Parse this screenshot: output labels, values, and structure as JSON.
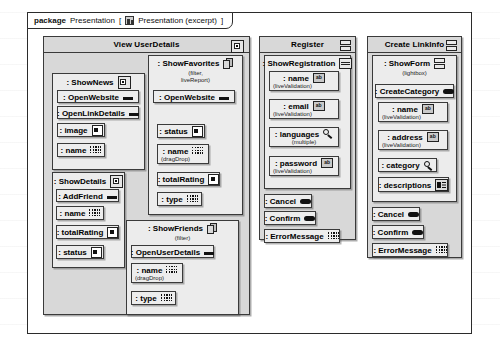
{
  "package": {
    "keyword": "package",
    "name": "Presentation",
    "bracket_open": "[",
    "icon": "diagram-icon",
    "diagram_label": "Presentation (excerpt)",
    "bracket_close": "]"
  },
  "columns": [
    {
      "id": "view-userdetails",
      "title": "View UserDetails",
      "icon": "window-icon"
    },
    {
      "id": "register",
      "title": "Register",
      "icon": "panes-icon"
    },
    {
      "id": "create-linkinfo",
      "title": "Create LinkInfo",
      "icon": "panes-icon"
    }
  ],
  "nodes": {
    "show_news": {
      "title": ": ShowNews",
      "icon": "window-icon",
      "items": [
        {
          "label": ": OpenWebsite",
          "icon": "link-icon",
          "note": ""
        },
        {
          "label": ": OpenLinkDetails",
          "icon": "link-icon",
          "note": ""
        },
        {
          "label": ": image",
          "icon": "image-icon",
          "note": ""
        },
        {
          "label": ": name",
          "icon": "text-icon",
          "note": ""
        }
      ]
    },
    "show_details": {
      "title": ": ShowDetails",
      "icon": "window-icon",
      "items": [
        {
          "label": ": AddFriend",
          "icon": "link-icon",
          "note": ""
        },
        {
          "label": ": name",
          "icon": "text-icon",
          "note": ""
        },
        {
          "label": ": totalRating",
          "icon": "image-icon",
          "note": ""
        },
        {
          "label": ": status",
          "icon": "image-icon",
          "note": ""
        }
      ]
    },
    "show_favorites": {
      "title": ": ShowFavorites",
      "icon": "stack-icon",
      "sub": "(filter,\nliveReport)",
      "sub_line1": "(filter,",
      "sub_line2": "liveReport)",
      "items": [
        {
          "label": ": OpenWebsite",
          "icon": "link-icon",
          "note": ""
        },
        {
          "label": ": status",
          "icon": "image-icon",
          "note": ""
        },
        {
          "label": ": name",
          "icon": "text-icon",
          "note": "(dragDrop)"
        },
        {
          "label": ": totalRating",
          "icon": "image-icon",
          "note": ""
        },
        {
          "label": ": type",
          "icon": "text-icon",
          "note": ""
        }
      ]
    },
    "show_friends": {
      "title": ": ShowFriends",
      "icon": "stack-icon",
      "sub_line1": "(filter)",
      "items": [
        {
          "label": ": OpenUserDetails",
          "icon": "link-icon",
          "note": ""
        },
        {
          "label": ": name",
          "icon": "text-icon",
          "note": "(dragDrop)"
        },
        {
          "label": ": type",
          "icon": "text-icon",
          "note": ""
        }
      ]
    },
    "show_registration": {
      "title": ": ShowRegistration",
      "icon": "panes2-icon",
      "items": [
        {
          "label": ": name",
          "icon": "ab-icon",
          "note": "(liveValidation)"
        },
        {
          "label": ": email",
          "icon": "ab-icon",
          "note": "(liveValidation)"
        },
        {
          "label": ": languages",
          "icon": "select-icon",
          "note": "(multiple)"
        },
        {
          "label": ": password",
          "icon": "ab-icon",
          "note": "(liveValidation)"
        }
      ]
    },
    "register_actions": [
      {
        "label": ": Cancel",
        "icon": "button-icon"
      },
      {
        "label": ": Confirm",
        "icon": "button-icon"
      },
      {
        "label": ": ErrorMessage",
        "icon": "text-icon"
      }
    ],
    "show_form": {
      "title": ": ShowForm",
      "icon": "panes-icon",
      "sub_line1": "(lightbox)",
      "create_category": {
        "label": ": CreateCategory",
        "icon": "button-icon"
      },
      "items": [
        {
          "label": ": name",
          "icon": "ab-icon",
          "note": "(liveValidation)"
        },
        {
          "label": ": address",
          "icon": "ab-icon",
          "note": "(liveValidation)"
        },
        {
          "label": ": category",
          "icon": "select-icon",
          "note": ""
        },
        {
          "label": ": descriptions",
          "icon": "desc-icon",
          "note": ""
        }
      ]
    },
    "linkinfo_actions": [
      {
        "label": ": Cancel",
        "icon": "button-icon"
      },
      {
        "label": ": Confirm",
        "icon": "button-icon"
      },
      {
        "label": ": ErrorMessage",
        "icon": "text-icon"
      }
    ]
  },
  "colors": {
    "panel_fill": "#d8d8d8",
    "node_fill": "#ececec",
    "leaf_fill": "#ededed",
    "stroke": "#3a3a3a",
    "page_bg": "#ffffff"
  }
}
